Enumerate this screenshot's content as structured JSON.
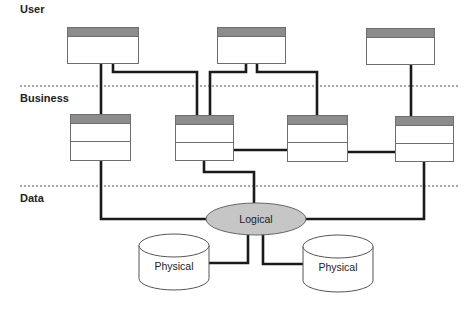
{
  "diagram": {
    "tiers": [
      {
        "label": "User",
        "y": 12,
        "separator_y": null
      },
      {
        "label": "Business",
        "y": 99,
        "separator_y": 86
      },
      {
        "label": "Data",
        "y": 199,
        "separator_y": 186
      }
    ],
    "separator_style": {
      "color": "#a8a8a8",
      "dash": "2 2",
      "x1": 20,
      "x2": 458
    },
    "colors": {
      "line": "#1a1a1a",
      "box_border": "#6e6e6e",
      "box_header": "#8c8c8c",
      "box_fill": "#ffffff",
      "ellipse_fill": "#c6c6c6",
      "ellipse_stroke": "#666666",
      "cylinder_stroke": "#555555"
    },
    "user_components": [
      {
        "id": "u1",
        "x": 67,
        "y": 27,
        "w": 71,
        "h": 36
      },
      {
        "id": "u2",
        "x": 217,
        "y": 27,
        "w": 68,
        "h": 36
      },
      {
        "id": "u3",
        "x": 366,
        "y": 28,
        "w": 68,
        "h": 36
      }
    ],
    "business_components": [
      {
        "id": "b1",
        "x": 70,
        "y": 114,
        "w": 60,
        "h": 46
      },
      {
        "id": "b2",
        "x": 175,
        "y": 115,
        "w": 58,
        "h": 45
      },
      {
        "id": "b3",
        "x": 287,
        "y": 115,
        "w": 60,
        "h": 46
      },
      {
        "id": "b4",
        "x": 395,
        "y": 116,
        "w": 58,
        "h": 45
      }
    ],
    "logical": {
      "label": "Logical",
      "cx": 256,
      "cy": 219,
      "rx": 50,
      "ry": 16
    },
    "physical": [
      {
        "label": "Physical",
        "x": 139,
        "y": 234,
        "w": 70,
        "h": 56
      },
      {
        "label": "Physical",
        "x": 303,
        "y": 235,
        "w": 70,
        "h": 57
      }
    ],
    "connectors": [
      "101,63 101,114",
      "113,63 113,72 197,72 197,115",
      "246,63 246,72 210,72 210,115",
      "257,63 257,72 317,72 317,115",
      "411,64 411,116",
      "233,150 287,150",
      "347,152 395,152",
      "101,160 101,219 206,219",
      "204,160 204,172 254,172 254,203",
      "305,219 424,219 424,161",
      "248,234 248,263 209,263",
      "263,234 263,264 303,264"
    ]
  }
}
